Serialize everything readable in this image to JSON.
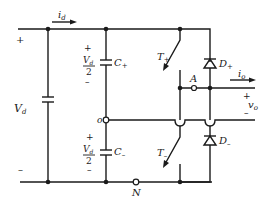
{
  "diagram": {
    "type": "circuit",
    "labels": {
      "input_current": "i",
      "input_current_sub": "d",
      "dc_source": "V",
      "dc_source_sub": "d",
      "dc_plus": "+",
      "dc_minus": "–",
      "cap_upper_plus": "+",
      "cap_upper_minus": "–",
      "cap_lower_plus": "+",
      "cap_lower_minus": "–",
      "half_voltage_num": "V",
      "half_voltage_num_sub": "d",
      "half_voltage_den": "2",
      "cap_upper": "C",
      "cap_upper_sub": "+",
      "cap_lower": "C",
      "cap_lower_sub": "–",
      "switch_upper": "T",
      "switch_upper_sub": "+",
      "switch_lower": "T",
      "switch_lower_sub": "–",
      "diode_upper": "D",
      "diode_upper_sub": "+",
      "diode_lower": "D",
      "diode_lower_sub": "–",
      "node_A": "A",
      "node_o": "o",
      "node_N": "N",
      "output_current": "i",
      "output_current_sub": "o",
      "output_voltage": "v",
      "output_voltage_sub": "o",
      "out_plus": "+",
      "out_minus": "–"
    },
    "components": [
      {
        "id": "Vd",
        "kind": "dc-source"
      },
      {
        "id": "C+",
        "kind": "capacitor"
      },
      {
        "id": "C-",
        "kind": "capacitor"
      },
      {
        "id": "T+",
        "kind": "switch"
      },
      {
        "id": "T-",
        "kind": "switch"
      },
      {
        "id": "D+",
        "kind": "diode"
      },
      {
        "id": "D-",
        "kind": "diode"
      }
    ],
    "nodes": [
      "A",
      "o",
      "N"
    ],
    "colors": {
      "ink": "#1a1a1a",
      "background": "#ffffff"
    }
  }
}
